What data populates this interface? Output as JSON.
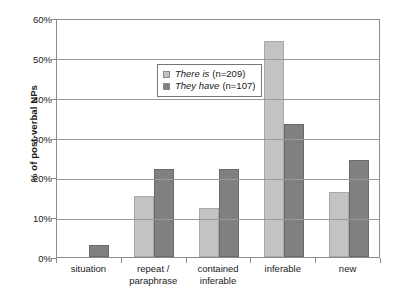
{
  "chart_data": {
    "type": "bar",
    "title": "",
    "subtitle": "",
    "xlabel": "",
    "ylabel": "% of post-verbal NPs",
    "ylim": [
      0,
      60
    ],
    "ytick_labels": [
      "0%",
      "10%",
      "20%",
      "30%",
      "40%",
      "50%",
      "60%"
    ],
    "ytick_values": [
      0,
      10,
      20,
      30,
      40,
      50,
      60
    ],
    "grid": true,
    "legend_position": "inside-top-center",
    "categories": [
      "situation",
      "repeat / paraphrase",
      "contained inferable",
      "inferable",
      "new"
    ],
    "category_lines": [
      [
        "situation"
      ],
      [
        "repeat /",
        "paraphrase"
      ],
      [
        "contained",
        "inferable"
      ],
      [
        "inferable"
      ],
      [
        "new"
      ]
    ],
    "series": [
      {
        "name": "There is (n=209)",
        "name_italic": "There is",
        "name_n": "(n=209)",
        "color": "#c3c3c3",
        "values": [
          0,
          15.2,
          12.3,
          54.3,
          16.3
        ]
      },
      {
        "name": "They have (n=107)",
        "name_italic": "They have",
        "name_n": "(n=107)",
        "color": "#808080",
        "values": [
          2.9,
          22.1,
          22.2,
          33.4,
          24.4
        ]
      }
    ]
  },
  "colors": {
    "series_0": "#c3c3c3",
    "series_1": "#808080",
    "gridline": "#9a9a9a",
    "axis": "#8b8b8b",
    "text": "#1a1a1a",
    "background": "#ffffff"
  }
}
